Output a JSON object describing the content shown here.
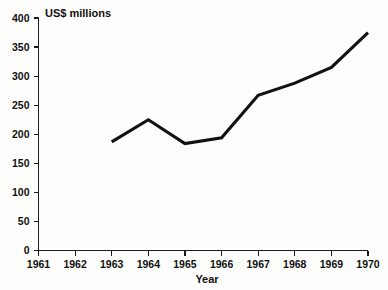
{
  "chart_data": {
    "type": "line",
    "title": "",
    "unit_label": "US$ millions",
    "xlabel": "Year",
    "ylabel": "",
    "x": [
      1961,
      1962,
      1963,
      1964,
      1965,
      1966,
      1967,
      1968,
      1969,
      1970
    ],
    "series": [
      {
        "name": "US$ millions",
        "x": [
          1963,
          1964,
          1965,
          1966,
          1967,
          1968,
          1969,
          1970
        ],
        "values": [
          187,
          225,
          184,
          194,
          267,
          288,
          315,
          375
        ],
        "color": "#111111"
      }
    ],
    "xtick_labels": [
      "1961",
      "1962",
      "1963",
      "1964",
      "1965",
      "1966",
      "1967",
      "1968",
      "1969",
      "1970"
    ],
    "ytick_labels": [
      "0",
      "50",
      "100",
      "150",
      "200",
      "250",
      "300",
      "350",
      "400"
    ],
    "yticks": [
      0,
      50,
      100,
      150,
      200,
      250,
      300,
      350,
      400
    ],
    "xlim": [
      1961,
      1970
    ],
    "ylim": [
      0,
      400
    ],
    "grid": false,
    "legend": false,
    "legend_position": "none",
    "background_color": "#fdfdfb",
    "axis_color": "#1b1b1b"
  }
}
